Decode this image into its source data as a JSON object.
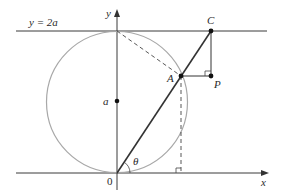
{
  "labels": {
    "line_eq": "y = 2a",
    "y_axis": "y",
    "x_axis": "x",
    "origin": "0",
    "center": "a",
    "point_A": "A",
    "point_C": "C",
    "point_P": "P",
    "angle": "θ"
  },
  "colors": {
    "circle": "#a8a8a8",
    "lines": "#333333",
    "background": "#ffffff"
  }
}
